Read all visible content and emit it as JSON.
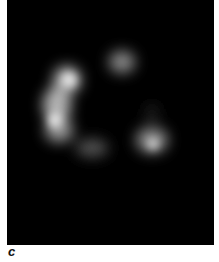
{
  "figure": {
    "panel_label": "c",
    "image_description": "Fluorescence micrograph: ring-shaped cluster of bright blurred spots on black background"
  }
}
